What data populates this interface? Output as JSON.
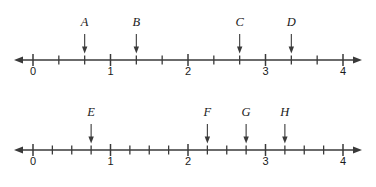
{
  "figure": {
    "background_color": "#ffffff",
    "ink_color": "#3a3a3a",
    "text_color": "#1a1a1a"
  },
  "chart_data": {
    "type": "scatter",
    "title": "",
    "xlabel": "",
    "ylabel": "",
    "grid": false,
    "legend": "none",
    "lines": [
      {
        "id": "line-1",
        "name": "Number line 1 (thirds)",
        "xlim": [
          0,
          4
        ],
        "tick_labels": [
          "0",
          "1",
          "2",
          "3",
          "4"
        ],
        "tick_values": [
          0,
          1,
          2,
          3,
          4
        ],
        "minor_ticks_per_unit": 3,
        "minor_tick_fraction": "1/3",
        "left_arrow": true,
        "right_arrow": true,
        "points": [
          {
            "label": "A",
            "value": 0.6667,
            "fraction": "2/3"
          },
          {
            "label": "B",
            "value": 1.3333,
            "fraction": "4/3"
          },
          {
            "label": "C",
            "value": 2.6667,
            "fraction": "8/3"
          },
          {
            "label": "D",
            "value": 3.3333,
            "fraction": "10/3"
          }
        ]
      },
      {
        "id": "line-2",
        "name": "Number line 2 (quarters)",
        "xlim": [
          0,
          4
        ],
        "tick_labels": [
          "0",
          "1",
          "2",
          "3",
          "4"
        ],
        "tick_values": [
          0,
          1,
          2,
          3,
          4
        ],
        "minor_ticks_per_unit": 4,
        "minor_tick_fraction": "1/4",
        "left_arrow": true,
        "right_arrow": true,
        "points": [
          {
            "label": "E",
            "value": 0.75,
            "fraction": "3/4"
          },
          {
            "label": "F",
            "value": 2.25,
            "fraction": "9/4"
          },
          {
            "label": "G",
            "value": 2.75,
            "fraction": "11/4"
          },
          {
            "label": "H",
            "value": 3.25,
            "fraction": "13/4"
          }
        ]
      }
    ]
  },
  "geometry": {
    "x_origin_px": 33,
    "px_per_unit": 77.5,
    "line1_axis_y": 60,
    "line2_axis_y": 150,
    "axis_overhang_px": 19,
    "major_tick_half": 6,
    "minor_tick_half": 4.5,
    "pointer_top_offset": 26,
    "pointer_head_len": 7,
    "pointer_head_half_w": 2.7,
    "label_gap_above": 8,
    "number_gap_below": 15
  }
}
